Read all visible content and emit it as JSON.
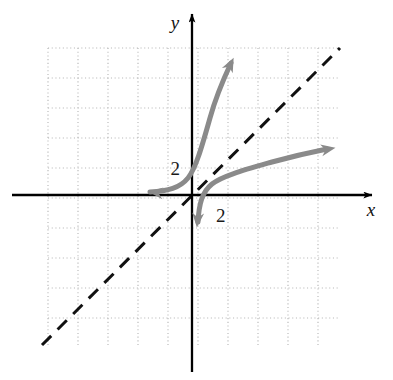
{
  "figure": {
    "background_color": "#ffffff"
  },
  "axes": {
    "x_label": "x",
    "y_label": "y",
    "axis_color": "#000000",
    "origin_px": {
      "x": 192,
      "y": 195
    },
    "x_axis_y_px": 195,
    "y_axis_x_px": 192,
    "x_axis_extent_px": {
      "from": 12,
      "to": 372
    },
    "y_axis_extent_px": {
      "from": 14,
      "to": 372
    },
    "x_label_pos_px": {
      "x": 371,
      "y": 216
    },
    "y_label_pos_px": {
      "x": 175,
      "y": 29
    }
  },
  "grid": {
    "color": "#b9b9b9",
    "style": "dotted",
    "spacing_px": 30,
    "left_px": 48,
    "right_px": 338,
    "top_px": 48,
    "bottom_px": 345,
    "columns": 10,
    "rows": 10
  },
  "tick_labels": [
    {
      "text": "2",
      "x": 180,
      "y": 175,
      "anchor": "end",
      "name": "y-intercept-label-2"
    },
    {
      "text": "2",
      "x": 216,
      "y": 222,
      "anchor": "start",
      "name": "x-intercept-label-2"
    }
  ],
  "reference_line": {
    "name": "y = x",
    "style": "dashed",
    "color": "#111111",
    "width_px": 3,
    "dash_pattern": "13 9",
    "from_px": {
      "x": 42,
      "y": 345
    },
    "to_px": {
      "x": 340,
      "y": 48
    }
  },
  "curves": [
    {
      "name": "exponential-curve",
      "description": "Exponential growth curve passing through (0, 2) with horizontal asymptote at y = 0",
      "color": "#8a8a8a",
      "width_px": 5,
      "path": "M 150 192 C 168 191 180 188 188 178 C 196 168 202 146 210 118 C 216 96 224 78 231 63",
      "arrows": [
        {
          "position": "left",
          "at_px": {
            "x": 150,
            "y": 192
          },
          "angle_deg": 186
        },
        {
          "position": "upper-right",
          "at_px": {
            "x": 233,
            "y": 59
          },
          "angle_deg": -64
        }
      ]
    },
    {
      "name": "logarithmic-curve",
      "description": "Logarithmic curve passing through (2, 0) with vertical asymptote at x = 0, the inverse reflection of the exponential curve",
      "color": "#8a8a8a",
      "width_px": 5,
      "path": "M 198 222 C 199 204 202 192 212 184 C 222 176 244 170 272 162 C 294 156 312 152 327 149",
      "arrows": [
        {
          "position": "down",
          "at_px": {
            "x": 197,
            "y": 226
          },
          "angle_deg": 95
        },
        {
          "position": "right",
          "at_px": {
            "x": 334,
            "y": 148
          },
          "angle_deg": -11
        }
      ]
    }
  ],
  "chart_data": {
    "type": "line",
    "title": "",
    "xlabel": "x",
    "ylabel": "y",
    "xlim": [
      -4.8,
      4.9
    ],
    "ylim": [
      -5.0,
      4.9
    ],
    "grid": true,
    "legend": "none",
    "unit_px": 30,
    "series": [
      {
        "name": "exponential",
        "style": "solid",
        "color": "#8a8a8a",
        "note": "y-intercept at (0, 2); horizontal asymptote y = 0; arrows both ends",
        "points": [
          {
            "x": -1.4,
            "y": 0.1
          },
          {
            "x": -0.9,
            "y": 0.2
          },
          {
            "x": -0.5,
            "y": 0.45
          },
          {
            "x": -0.13,
            "y": 0.9
          },
          {
            "x": 0.0,
            "y": 1.5
          },
          {
            "x": 0.17,
            "y": 1.95
          },
          {
            "x": 0.6,
            "y": 2.8
          },
          {
            "x": 1.0,
            "y": 3.8
          },
          {
            "x": 1.3,
            "y": 4.4
          }
        ]
      },
      {
        "name": "logarithmic",
        "style": "solid",
        "color": "#8a8a8a",
        "note": "x-intercept at (2, 0); vertical asymptote x = 0; arrows both ends",
        "points": [
          {
            "x": 0.17,
            "y": -1.05
          },
          {
            "x": 0.25,
            "y": -0.6
          },
          {
            "x": 0.45,
            "y": -0.1
          },
          {
            "x": 0.95,
            "y": 0.4
          },
          {
            "x": 1.6,
            "y": 0.9
          },
          {
            "x": 2.7,
            "y": 1.1
          },
          {
            "x": 3.6,
            "y": 1.4
          },
          {
            "x": 4.5,
            "y": 1.55
          }
        ]
      },
      {
        "name": "y = x",
        "style": "dashed",
        "color": "#111111",
        "note": "axis of symmetry between the two curves",
        "points": [
          {
            "x": -5.0,
            "y": -5.0
          },
          {
            "x": 4.93,
            "y": 4.9
          }
        ]
      }
    ],
    "annotations": [
      {
        "text": "2",
        "x": -0.35,
        "y": 0.9,
        "note": "y-intercept of exponential curve"
      },
      {
        "text": "2",
        "x": 0.8,
        "y": -0.85,
        "note": "x-intercept of logarithmic curve"
      }
    ]
  }
}
